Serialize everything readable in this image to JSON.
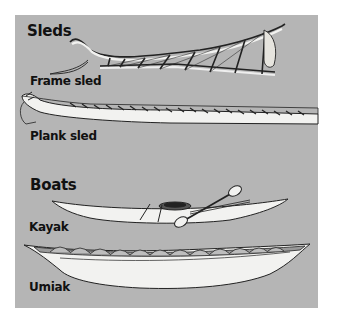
{
  "colors": {
    "panel_bg": "#b5b5b5",
    "page_bg": "#ffffff",
    "ink": "#111111",
    "hull_fill": "#f2f2f0"
  },
  "sections": [
    {
      "heading": "Sleds",
      "items": [
        {
          "label": "Frame sled",
          "icon": "frame-sled-illustration"
        },
        {
          "label": "Plank sled",
          "icon": "plank-sled-illustration"
        }
      ]
    },
    {
      "heading": "Boats",
      "items": [
        {
          "label": "Kayak",
          "icon": "kayak-illustration"
        },
        {
          "label": "Umiak",
          "icon": "umiak-illustration"
        }
      ]
    }
  ]
}
